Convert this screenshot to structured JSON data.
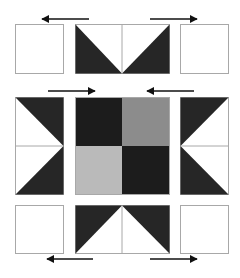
{
  "diagram": {
    "colors": {
      "background": "#ffffff",
      "outline": "#a8a8a8",
      "dark": "#262626",
      "center_dark": "#1c1c1c",
      "center_medium": "#8c8c8c",
      "center_light": "#bababa",
      "arrow": "#111111"
    },
    "rows": [
      {
        "name": "top-row",
        "units": [
          "plain-square",
          "flying-geese-down",
          "plain-square"
        ],
        "arrows": [
          {
            "direction": "left",
            "x1": 89,
            "x2": 42,
            "y": 19
          },
          {
            "direction": "right",
            "x1": 150,
            "x2": 197,
            "y": 19
          }
        ]
      },
      {
        "name": "middle-row",
        "units": [
          "flying-geese-right",
          "four-patch",
          "flying-geese-left"
        ],
        "arrows": [
          {
            "direction": "right",
            "x1": 48,
            "x2": 95,
            "y": 91
          },
          {
            "direction": "left",
            "x1": 194,
            "x2": 147,
            "y": 91
          }
        ]
      },
      {
        "name": "bottom-row",
        "units": [
          "plain-square",
          "flying-geese-up",
          "plain-square"
        ],
        "arrows": [
          {
            "direction": "left",
            "x1": 93,
            "x2": 47,
            "y": 259
          },
          {
            "direction": "right",
            "x1": 150,
            "x2": 197,
            "y": 259
          }
        ]
      }
    ]
  }
}
